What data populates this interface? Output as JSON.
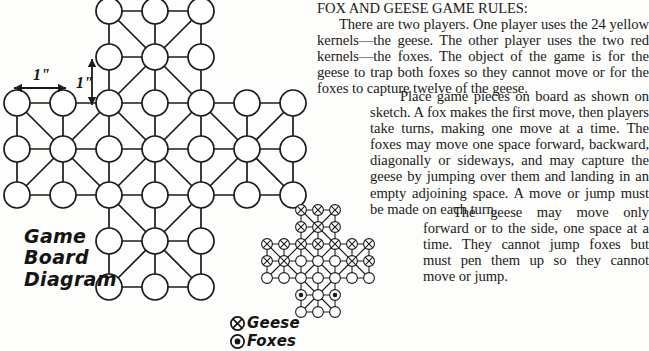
{
  "page": {
    "background": "#fdfdfb",
    "ink": "#1a1a1a"
  },
  "diagram": {
    "caption": "Game\nBoard\nDiagram",
    "dimension_labels": {
      "horizontal": "1\"",
      "vertical": "1\""
    },
    "board": {
      "type": "cross",
      "grid_size": 7,
      "arm_width": 3,
      "spacing_px": 46,
      "hole_radius_px": 13,
      "note": "33-hole plus-shaped Fox and Geese board with orthogonal and diagonal links"
    }
  },
  "legend": {
    "items": [
      {
        "symbol": "circle-x",
        "label": "Geese"
      },
      {
        "symbol": "circle-dot",
        "label": "Foxes"
      }
    ]
  },
  "sketch": {
    "type": "cross",
    "grid_size": 7,
    "arm_width": 3,
    "spacing_px": 17,
    "hole_radius_px": 5.4,
    "geese_count": 24,
    "foxes_count": 2
  },
  "rules": {
    "heading": "FOX AND GEESE GAME RULES:",
    "paragraphs": [
      "There are two players. One player uses the 24 yellow kernels—the geese. The other player uses the two red kernels—the foxes. The object of the game is for the geese to trap both foxes so they cannot move or for the foxes to capture twelve of the geese.",
      "Place game pieces on board as shown on sketch. A fox makes the first move, then players take turns, making one move at a time. The foxes may move one space forward, backward, diagonally or sideways, and may capture the geese by jumping over them and landing in an empty adjoining space. A move or jump must be made on each turn.",
      "The geese may move only forward or to the side, one space at a time. They cannot jump foxes but must pen them up so they cannot move or jump."
    ]
  }
}
